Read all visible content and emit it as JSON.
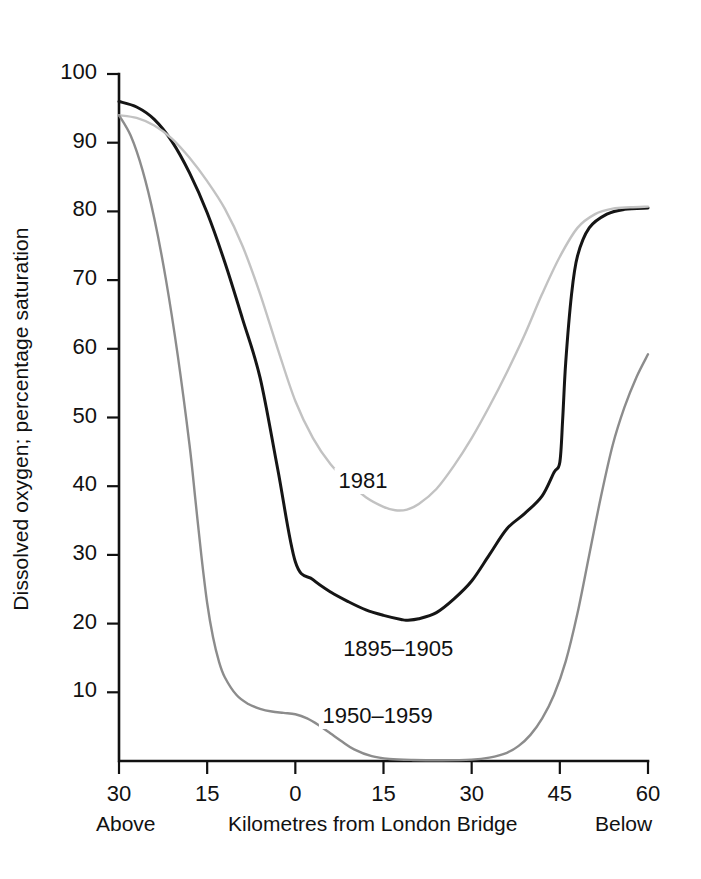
{
  "chart_data": {
    "type": "line",
    "title": "",
    "xlabel": "Kilometres from London Bridge",
    "ylabel": "Dissolved oxygen; percentage saturation",
    "xlim": [
      -30,
      60
    ],
    "ylim": [
      0,
      100
    ],
    "grid": false,
    "legend_position": "inline-annotations",
    "x_tick_values": [
      -30,
      -15,
      0,
      15,
      30,
      45,
      60
    ],
    "x_tick_labels": [
      "30",
      "15",
      "0",
      "15",
      "30",
      "45",
      "60"
    ],
    "y_tick_values": [
      10,
      20,
      30,
      40,
      50,
      60,
      70,
      80,
      90,
      100
    ],
    "y_tick_labels": [
      "10",
      "20",
      "30",
      "40",
      "50",
      "60",
      "70",
      "80",
      "90",
      "100"
    ],
    "x_axis_left_caption": "Above",
    "x_axis_right_caption": "Below",
    "series": [
      {
        "name": "1895–1905",
        "color": "#151515",
        "label_text": "1895–1905",
        "x": [
          -30,
          -27,
          -24,
          -21,
          -18,
          -15,
          -12,
          -9,
          -6,
          -3,
          0,
          3,
          6,
          9,
          12,
          15,
          18,
          19,
          21,
          24,
          27,
          30,
          33,
          36,
          39,
          42,
          44,
          45,
          45.5,
          46,
          47,
          48,
          50,
          53,
          56,
          60
        ],
        "y": [
          96,
          95.2,
          93.4,
          90.2,
          85.6,
          79.8,
          72.6,
          64.4,
          55.8,
          42.5,
          29.0,
          26.4,
          24.6,
          23.2,
          22.0,
          21.2,
          20.6,
          20.5,
          20.7,
          21.6,
          23.6,
          26.2,
          30.0,
          33.8,
          36.0,
          38.6,
          42.0,
          43.5,
          50.0,
          58.0,
          68.0,
          73.5,
          77.6,
          79.6,
          80.3,
          80.5
        ]
      },
      {
        "name": "1981",
        "color": "#c2c2c2",
        "label_text": "1981",
        "x": [
          -30,
          -27,
          -24,
          -21,
          -18,
          -15,
          -12,
          -9,
          -6,
          -3,
          0,
          3,
          6,
          9,
          12,
          15,
          17,
          19,
          21,
          24,
          27,
          30,
          33,
          36,
          39,
          42,
          45,
          48,
          51,
          54,
          57,
          60
        ],
        "y": [
          94,
          93.6,
          92.5,
          90.6,
          87.8,
          84.4,
          80.4,
          75.0,
          68.0,
          60.0,
          52.4,
          47.0,
          43.2,
          40.6,
          38.4,
          37.0,
          36.5,
          36.6,
          37.4,
          39.6,
          43.0,
          47.0,
          51.6,
          56.6,
          62.0,
          68.0,
          73.4,
          77.6,
          79.6,
          80.4,
          80.6,
          80.7
        ]
      },
      {
        "name": "1950–1959",
        "color": "#8c8c8c",
        "label_text": "1950–1959",
        "x": [
          -30,
          -28,
          -26,
          -24,
          -22,
          -20,
          -18,
          -17,
          -16,
          -15,
          -14,
          -13,
          -12,
          -10,
          -8,
          -6,
          -4,
          -2,
          0,
          2,
          4,
          6,
          8,
          10,
          13,
          16,
          20,
          25,
          30,
          33,
          36,
          38,
          40,
          42,
          44,
          46,
          48,
          50,
          52,
          54,
          56,
          58,
          60
        ],
        "y": [
          94,
          91.0,
          86.0,
          79.0,
          70.0,
          59.0,
          46.0,
          38.0,
          30.0,
          23.0,
          18.0,
          14.5,
          12.2,
          9.6,
          8.3,
          7.6,
          7.2,
          7.0,
          6.8,
          6.2,
          5.2,
          4.0,
          2.8,
          1.7,
          0.7,
          0.3,
          0.15,
          0.1,
          0.2,
          0.5,
          1.2,
          2.2,
          3.8,
          6.2,
          9.6,
          14.5,
          21.5,
          30.0,
          38.5,
          46.0,
          51.5,
          55.8,
          59.2
        ]
      }
    ],
    "annotations": [
      {
        "text": "1981",
        "x": 11.5,
        "y": 40.5
      },
      {
        "text": "1895–1905",
        "x": 17.5,
        "y": 16.0
      },
      {
        "text": "1950–1959",
        "x": 14.0,
        "y": 6.2
      }
    ]
  }
}
